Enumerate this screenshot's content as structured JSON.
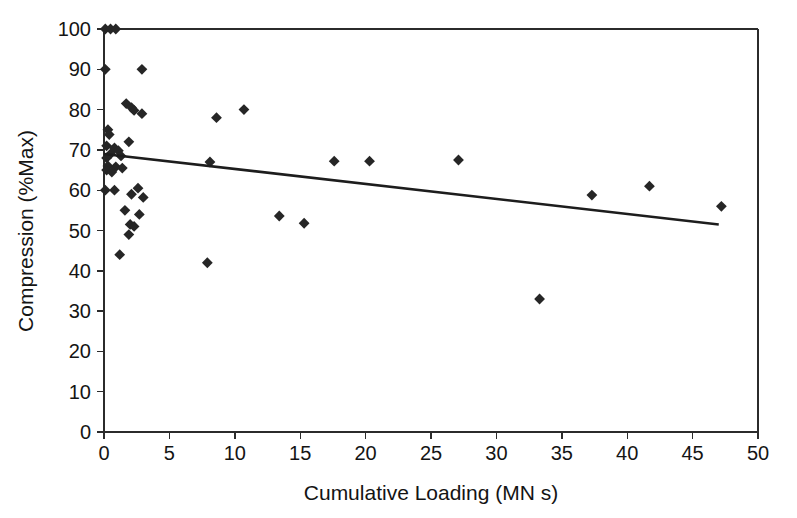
{
  "chart_data": {
    "type": "scatter",
    "title": "",
    "xlabel": "Cumulative Loading (MN s)",
    "ylabel": "Compression (%Max)",
    "xlim": [
      0,
      50
    ],
    "ylim": [
      0,
      100
    ],
    "xticks": [
      0,
      5,
      10,
      15,
      20,
      25,
      30,
      35,
      40,
      45,
      50
    ],
    "yticks": [
      0,
      10,
      20,
      30,
      40,
      50,
      60,
      70,
      80,
      90,
      100
    ],
    "xtick_labels": [
      "0",
      "5",
      "10",
      "15",
      "20",
      "25",
      "30",
      "35",
      "40",
      "45",
      "50"
    ],
    "ytick_labels": [
      "0",
      "10",
      "20",
      "30",
      "40",
      "50",
      "60",
      "70",
      "80",
      "90",
      "100"
    ],
    "grid": false,
    "legend": false,
    "marker_shape": "diamond",
    "marker_color": "#262626",
    "series": [
      {
        "name": "Compression vs Cumulative Loading",
        "marker": "diamond",
        "points": [
          [
            0.1,
            100.0
          ],
          [
            0.5,
            100.0
          ],
          [
            0.9,
            100.0
          ],
          [
            0.1,
            90.0
          ],
          [
            2.9,
            90.0
          ],
          [
            1.7,
            81.5
          ],
          [
            2.1,
            80.5
          ],
          [
            2.3,
            79.8
          ],
          [
            10.7,
            80.0
          ],
          [
            8.6,
            78.0
          ],
          [
            2.9,
            79.0
          ],
          [
            0.3,
            75.0
          ],
          [
            0.4,
            73.8
          ],
          [
            1.9,
            72.0
          ],
          [
            0.2,
            71.0
          ],
          [
            0.8,
            70.5
          ],
          [
            1.1,
            69.8
          ],
          [
            0.5,
            69.0
          ],
          [
            1.3,
            68.5
          ],
          [
            0.2,
            68.0
          ],
          [
            17.6,
            67.2
          ],
          [
            20.3,
            67.2
          ],
          [
            27.1,
            67.5
          ],
          [
            8.1,
            67.0
          ],
          [
            0.3,
            66.0
          ],
          [
            0.9,
            65.8
          ],
          [
            1.4,
            65.5
          ],
          [
            0.2,
            65.0
          ],
          [
            0.6,
            64.5
          ],
          [
            0.1,
            60.0
          ],
          [
            0.8,
            60.0
          ],
          [
            2.6,
            60.5
          ],
          [
            2.1,
            59.0
          ],
          [
            3.0,
            58.2
          ],
          [
            37.3,
            58.8
          ],
          [
            41.7,
            61.0
          ],
          [
            47.2,
            56.0
          ],
          [
            1.6,
            55.0
          ],
          [
            2.7,
            54.0
          ],
          [
            13.4,
            53.6
          ],
          [
            15.3,
            51.8
          ],
          [
            2.0,
            51.5
          ],
          [
            2.3,
            51.0
          ],
          [
            1.9,
            49.0
          ],
          [
            1.2,
            44.0
          ],
          [
            7.9,
            42.0
          ],
          [
            33.3,
            33.0
          ]
        ]
      }
    ],
    "trendline": {
      "name": "linear fit",
      "x_start": 0.0,
      "y_start": 69.0,
      "x_end": 47.0,
      "y_end": 51.5,
      "color": "#1d1d1d"
    }
  },
  "axes": {
    "x_title": "Cumulative Loading (MN s)",
    "y_title": "Compression (%Max)"
  }
}
